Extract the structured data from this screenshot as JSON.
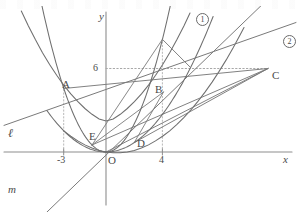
{
  "figure": {
    "type": "math-coordinate-plane",
    "axes": {
      "x_label": "x",
      "y_label": "y",
      "origin_label": "O",
      "x_ticks": [
        {
          "label": "-3",
          "value": -3
        },
        {
          "label": "4",
          "value": 4
        }
      ],
      "y_ticks": [
        {
          "label": "6",
          "value": 6
        }
      ]
    },
    "curve_labels": [
      {
        "name": "curve-1",
        "label": "1"
      },
      {
        "name": "curve-2",
        "label": "2"
      }
    ],
    "line_labels": [
      {
        "name": "line-l",
        "label": "ℓ"
      },
      {
        "name": "line-m",
        "label": "m"
      }
    ],
    "points": [
      {
        "label": "A",
        "x": -3,
        "y": 4.5
      },
      {
        "label": "B",
        "x": 4,
        "y": 8
      },
      {
        "label": "C",
        "x": 6,
        "y": 6
      },
      {
        "label": "D",
        "x": 2,
        "y": 0.67
      },
      {
        "label": "E",
        "x": -1,
        "y": 0.5
      }
    ],
    "stroke_color": "#6f6f6f",
    "guide_color": "#9a9a9a",
    "text_color": "#4a4a4a"
  },
  "chart_data": {
    "type": "line",
    "title": "",
    "xlabel": "x",
    "ylabel": "y",
    "xlim": [
      -7.2,
      13.5
    ],
    "ylim": [
      -4.2,
      10
    ],
    "grid": false,
    "legend": "in-plot circled numbers",
    "series": [
      {
        "name": "1",
        "kind": "parabola",
        "equation": "y = 0.5*x^2",
        "x": [
          -6.5,
          -5,
          -4,
          -3,
          -2,
          -1,
          0,
          1,
          2,
          3,
          4,
          4.6
        ],
        "values": [
          21.1,
          12.5,
          8,
          4.5,
          2,
          0.5,
          0,
          0.5,
          2,
          4.5,
          8,
          10.6
        ]
      },
      {
        "name": "2",
        "kind": "parabola",
        "equation": "y = x^2/6",
        "x": [
          -3,
          -2,
          -1,
          0,
          1,
          2,
          3,
          4,
          5,
          6,
          7
        ],
        "values": [
          1.5,
          0.67,
          0.17,
          0,
          0.17,
          0.67,
          1.5,
          2.67,
          4.17,
          6,
          8.17
        ]
      },
      {
        "name": "l",
        "kind": "line",
        "equation": "y = 0.5*x + 6",
        "x": [
          -7.2,
          13.5
        ],
        "values": [
          2.4,
          12.75
        ]
      },
      {
        "name": "m",
        "kind": "line",
        "equation": "y = x",
        "x": [
          -4.2,
          9
        ],
        "values": [
          -4.2,
          9
        ]
      },
      {
        "name": "BC",
        "kind": "segment",
        "x": [
          4,
          6
        ],
        "values": [
          8,
          6
        ]
      },
      {
        "name": "AC",
        "kind": "segment",
        "x": [
          -3,
          6
        ],
        "values": [
          4.5,
          6
        ]
      },
      {
        "name": "EC",
        "kind": "segment",
        "x": [
          -1,
          6
        ],
        "values": [
          0.5,
          6
        ]
      },
      {
        "name": "DC",
        "kind": "segment",
        "x": [
          2,
          6
        ],
        "values": [
          0.67,
          6
        ]
      },
      {
        "name": "y6-guide",
        "kind": "dotted-horizontal",
        "x": [
          0,
          6
        ],
        "values": [
          6,
          6
        ]
      },
      {
        "name": "A-dropline",
        "kind": "dotted-vertical",
        "x": [
          -3,
          -3
        ],
        "values": [
          0,
          4.5
        ]
      },
      {
        "name": "B-dropline",
        "kind": "dotted-vertical",
        "x": [
          4,
          4
        ],
        "values": [
          0,
          8
        ]
      }
    ]
  }
}
